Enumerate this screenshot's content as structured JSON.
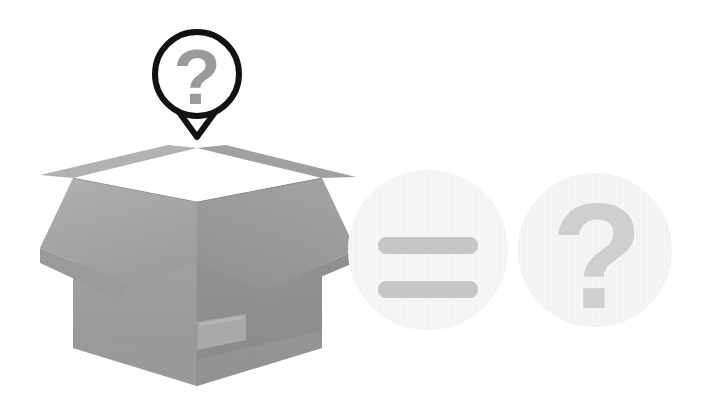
{
  "scene": {
    "title": "Mystery box illustration",
    "background_color": "#ffffff",
    "width": 705,
    "height": 414
  },
  "speech_bubble": {
    "name": "question-speech-bubble",
    "symbol": "?",
    "outline_color": "#121212",
    "fill_color": "#ffffff",
    "glyph_color": "#9a9a9a",
    "center_x": 197,
    "center_y": 74,
    "radius": 45,
    "stroke_width": 6,
    "tail_tip_x": 197,
    "tail_tip_y": 137
  },
  "box": {
    "name": "open-cardboard-box",
    "colors": {
      "flap_light": "#a8a8a8",
      "flap_mid": "#9c9c9c",
      "flap_dark": "#8e8e8e",
      "interior_back_left": "#6f6f6f",
      "interior_back_right": "#4a4a4a",
      "front_left": "#9b9b9b",
      "front_right": "#8d8d8d",
      "bottom_band": "#989898",
      "label_patch": "#aeaeae",
      "sphere": "#efefef",
      "sphere_shade": "#e0e0e0"
    },
    "label_patch": {
      "name": "shipping-label-patch",
      "x": 196,
      "y": 318,
      "width": 50,
      "height": 31
    },
    "contents": {
      "name": "hidden-sphere",
      "shape": "sphere",
      "center_x": 197,
      "center_y": 243,
      "radius": 42
    },
    "bounds": {
      "left": 40,
      "right": 356,
      "top": 148,
      "bottom": 386
    }
  },
  "icon_circles": [
    {
      "name": "equals-sign-circle",
      "symbol": "=",
      "symbol_label": "equals-icon",
      "circle_fill": "#efefef",
      "glyph_color": "#c6c6c6",
      "center_x": 428,
      "center_y": 250,
      "radius": 80,
      "bars": [
        {
          "x": 378,
          "y": 237,
          "width": 100,
          "height": 17,
          "radius": 8
        },
        {
          "x": 378,
          "y": 281,
          "width": 100,
          "height": 17,
          "radius": 8
        }
      ]
    },
    {
      "name": "question-mark-circle",
      "symbol": "?",
      "symbol_label": "question-mark-icon",
      "circle_fill": "#ececec",
      "glyph_color": "#cfcfcf",
      "center_x": 595,
      "center_y": 250,
      "radius": 77,
      "glyph_font_size": 150
    }
  ]
}
